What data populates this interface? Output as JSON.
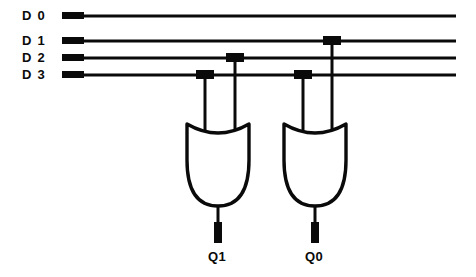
{
  "diagram": {
    "background_color": "#ffffff",
    "line_color": "#0a0a0a",
    "inputs": [
      {
        "id": "d0",
        "label": "D 0",
        "label_x": 22,
        "label_y": 9,
        "wire_y": 16,
        "wire_x1": 62,
        "wire_x2": 456
      },
      {
        "id": "d1",
        "label": "D 1",
        "label_x": 22,
        "label_y": 34,
        "wire_y": 41,
        "wire_x1": 62,
        "wire_x2": 456
      },
      {
        "id": "d2",
        "label": "D 2",
        "label_x": 22,
        "label_y": 51,
        "wire_y": 58,
        "wire_x1": 62,
        "wire_x2": 456
      },
      {
        "id": "d3",
        "label": "D 3",
        "label_x": 22,
        "label_y": 68,
        "wire_y": 75,
        "wire_x1": 62,
        "wire_x2": 456
      }
    ],
    "gates": [
      {
        "id": "gate-q1",
        "type": "OR",
        "cx": 218,
        "top_y": 124,
        "bottom_y": 206,
        "half_width": 31,
        "output_label": "Q1",
        "output_label_x": 208,
        "output_label_y": 256,
        "output_stem_y2": 243,
        "inputs": [
          {
            "from": "d3",
            "x": 205,
            "y": 75
          },
          {
            "from": "d2",
            "x": 235,
            "y": 58
          }
        ]
      },
      {
        "id": "gate-q0",
        "type": "OR",
        "cx": 315,
        "top_y": 124,
        "bottom_y": 206,
        "half_width": 31,
        "output_label": "Q0",
        "output_label_x": 305,
        "output_label_y": 256,
        "output_stem_y2": 243,
        "inputs": [
          {
            "from": "d3",
            "x": 303,
            "y": 75
          },
          {
            "from": "d1",
            "x": 332,
            "y": 41
          }
        ]
      }
    ],
    "junction_dots": [
      {
        "x": 205,
        "y": 75
      },
      {
        "x": 235,
        "y": 58
      },
      {
        "x": 303,
        "y": 75
      },
      {
        "x": 332,
        "y": 41
      }
    ]
  }
}
